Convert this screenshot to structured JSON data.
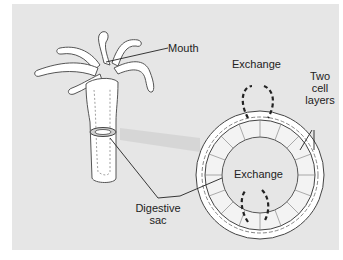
{
  "diagram": {
    "labels": {
      "mouth": "Mouth",
      "exchange_top": "Exchange",
      "exchange_inner": "Exchange",
      "two_cell_layers_line1": "Two",
      "two_cell_layers_line2": "cell",
      "two_cell_layers_line3": "layers",
      "digestive_sac_line1": "Digestive",
      "digestive_sac_line2": "sac"
    },
    "colors": {
      "background": "#e6e6e6",
      "organism_fill": "#ffffff",
      "outline": "#333333",
      "arrow": "#222222"
    }
  }
}
